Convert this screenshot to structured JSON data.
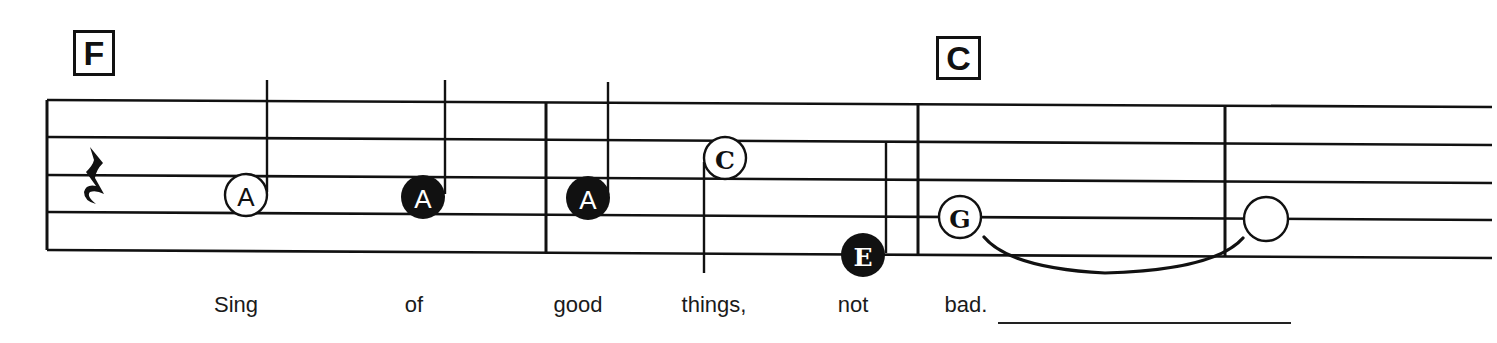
{
  "chords": [
    {
      "label": "F",
      "x": 73,
      "y": 30,
      "w": 42,
      "h": 46
    },
    {
      "label": "C",
      "x": 936,
      "y": 36,
      "w": 45,
      "h": 44
    }
  ],
  "staff": {
    "lines_left_y": [
      100,
      137,
      175,
      212,
      250
    ],
    "lines_right_y": [
      107,
      145,
      183,
      220,
      258
    ],
    "x_start": 47,
    "x_end": 1492,
    "barlines": [
      47,
      546,
      918,
      1225
    ]
  },
  "rest": {
    "type": "quarter-rest",
    "x": 93,
    "y": 175
  },
  "notes": [
    {
      "letter": "A",
      "filled": false,
      "cx": 246,
      "cy": 195,
      "stem": "up",
      "duration": "quarter"
    },
    {
      "letter": "A",
      "filled": true,
      "cx": 423,
      "cy": 197,
      "stem": "up",
      "duration": "quarter"
    },
    {
      "letter": "A",
      "filled": true,
      "cx": 588,
      "cy": 198,
      "stem": "up",
      "duration": "quarter"
    },
    {
      "letter": "C",
      "filled": false,
      "cx": 725,
      "cy": 158,
      "stem": "down",
      "duration": "half"
    },
    {
      "letter": "E",
      "filled": true,
      "cx": 863,
      "cy": 255,
      "stem": "up",
      "duration": "quarter"
    },
    {
      "letter": "G",
      "filled": false,
      "cx": 960,
      "cy": 217,
      "stem": "none",
      "duration": "whole"
    },
    {
      "letter": "",
      "filled": false,
      "cx": 1266,
      "cy": 219,
      "stem": "none",
      "duration": "whole"
    }
  ],
  "tie": {
    "from_note": 5,
    "to_note": 6
  },
  "lyrics": [
    {
      "text": "Sing",
      "x": 236
    },
    {
      "text": "of",
      "x": 414
    },
    {
      "text": "good",
      "x": 578
    },
    {
      "text": "things,",
      "x": 714
    },
    {
      "text": "not",
      "x": 853
    },
    {
      "text": "bad.",
      "x": 966
    }
  ],
  "colors": {
    "ink": "#111111",
    "paper": "#ffffff"
  }
}
